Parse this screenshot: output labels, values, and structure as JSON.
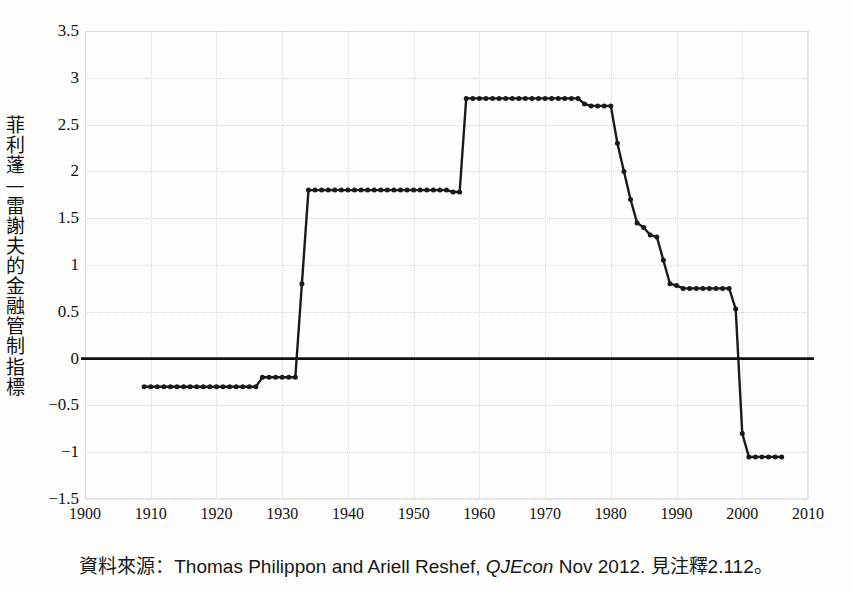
{
  "figure": {
    "title_remnant": "",
    "background_color": "#fdfdfc",
    "line_color": "#1a1a1a",
    "grid_color": "#d6d6d6",
    "zero_line_color": "#111111"
  },
  "axis": {
    "y_title": "菲利蓬—雷謝夫的金融管制指標",
    "y_ticks": [
      "3.5",
      "3",
      "2.5",
      "2",
      "1.5",
      "1",
      "0.5",
      "0",
      "−0.5",
      "−1",
      "−1.5"
    ],
    "x_ticks": [
      "1900",
      "1910",
      "1920",
      "1930",
      "1940",
      "1950",
      "1960",
      "1970",
      "1980",
      "1990",
      "2000",
      "2010"
    ]
  },
  "caption": {
    "prefix": "資料來源：Thomas Philippon and Ariell Reshef, ",
    "journal": "QJEcon",
    "suffix": " Nov 2012. 見注釋2.112。"
  },
  "chart_data": {
    "type": "line",
    "title": "",
    "xlabel": "",
    "ylabel": "菲利蓬—雷謝夫的金融管制指標",
    "xlim": [
      1900,
      2010
    ],
    "ylim": [
      -1.5,
      3.5
    ],
    "grid": true,
    "legend": null,
    "markers": true,
    "zero_line": true,
    "series": [
      {
        "name": "Philippon-Reshef financial deregulation index",
        "x": [
          1909,
          1910,
          1911,
          1912,
          1913,
          1914,
          1915,
          1916,
          1917,
          1918,
          1919,
          1920,
          1921,
          1922,
          1923,
          1924,
          1925,
          1926,
          1927,
          1928,
          1929,
          1930,
          1931,
          1932,
          1933,
          1934,
          1935,
          1936,
          1937,
          1938,
          1939,
          1940,
          1941,
          1942,
          1943,
          1944,
          1945,
          1946,
          1947,
          1948,
          1949,
          1950,
          1951,
          1952,
          1953,
          1954,
          1955,
          1956,
          1957,
          1958,
          1959,
          1960,
          1961,
          1962,
          1963,
          1964,
          1965,
          1966,
          1967,
          1968,
          1969,
          1970,
          1971,
          1972,
          1973,
          1974,
          1975,
          1976,
          1977,
          1978,
          1979,
          1980,
          1981,
          1982,
          1983,
          1984,
          1985,
          1986,
          1987,
          1988,
          1989,
          1990,
          1991,
          1992,
          1993,
          1994,
          1995,
          1996,
          1997,
          1998,
          1999,
          2000,
          2001,
          2002,
          2003,
          2004,
          2005,
          2006
        ],
        "y": [
          -0.3,
          -0.3,
          -0.3,
          -0.3,
          -0.3,
          -0.3,
          -0.3,
          -0.3,
          -0.3,
          -0.3,
          -0.3,
          -0.3,
          -0.3,
          -0.3,
          -0.3,
          -0.3,
          -0.3,
          -0.3,
          -0.2,
          -0.2,
          -0.2,
          -0.2,
          -0.2,
          -0.2,
          0.8,
          1.8,
          1.8,
          1.8,
          1.8,
          1.8,
          1.8,
          1.8,
          1.8,
          1.8,
          1.8,
          1.8,
          1.8,
          1.8,
          1.8,
          1.8,
          1.8,
          1.8,
          1.8,
          1.8,
          1.8,
          1.8,
          1.8,
          1.78,
          1.78,
          2.78,
          2.78,
          2.78,
          2.78,
          2.78,
          2.78,
          2.78,
          2.78,
          2.78,
          2.78,
          2.78,
          2.78,
          2.78,
          2.78,
          2.78,
          2.78,
          2.78,
          2.78,
          2.72,
          2.7,
          2.7,
          2.7,
          2.7,
          2.3,
          2.0,
          1.7,
          1.45,
          1.4,
          1.32,
          1.3,
          1.05,
          0.8,
          0.78,
          0.75,
          0.75,
          0.75,
          0.75,
          0.75,
          0.75,
          0.75,
          0.75,
          0.53,
          -0.8,
          -1.05,
          -1.05,
          -1.05,
          -1.05,
          -1.05,
          -1.05
        ]
      }
    ]
  }
}
